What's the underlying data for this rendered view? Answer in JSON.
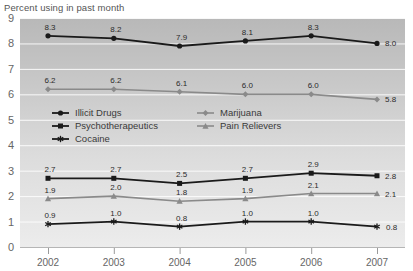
{
  "chart_data": {
    "type": "line",
    "title": "Percent using in past month",
    "xlabel": "",
    "ylabel": "",
    "categories": [
      "2002",
      "2003",
      "2004",
      "2005",
      "2006",
      "2007"
    ],
    "x": [
      2002,
      2003,
      2004,
      2005,
      2006,
      2007
    ],
    "ylim": [
      0,
      9
    ],
    "yticks": [
      "0",
      "1",
      "2",
      "3",
      "4",
      "5",
      "6",
      "7",
      "8",
      "9"
    ],
    "grid": true,
    "legend_position": "inside-upper-left",
    "series": [
      {
        "name": "Illicit Drugs",
        "marker": "circle",
        "color": "#1a1a1a",
        "values": [
          8.3,
          8.2,
          7.9,
          8.1,
          8.3,
          8.0
        ],
        "labels": [
          "8.3",
          "8.2",
          "7.9",
          "8.1",
          "8.3",
          "8.0"
        ]
      },
      {
        "name": "Marijuana",
        "marker": "diamond",
        "color": "#8a8a8a",
        "values": [
          6.2,
          6.2,
          6.1,
          6.0,
          6.0,
          5.8
        ],
        "labels": [
          "6.2",
          "6.2",
          "6.1",
          "6.0",
          "6.0",
          "5.8"
        ]
      },
      {
        "name": "Psychotherapeutics",
        "marker": "square",
        "color": "#1a1a1a",
        "values": [
          2.7,
          2.7,
          2.5,
          2.7,
          2.9,
          2.8
        ],
        "labels": [
          "2.7",
          "2.7",
          "2.5",
          "2.7",
          "2.9",
          "2.8"
        ]
      },
      {
        "name": "Pain Relievers",
        "marker": "triangle",
        "color": "#8a8a8a",
        "values": [
          1.9,
          2.0,
          1.8,
          1.9,
          2.1,
          2.1
        ],
        "labels": [
          "1.9",
          "2.0",
          "1.8",
          "1.9",
          "2.1",
          "2.1"
        ]
      },
      {
        "name": "Cocaine",
        "marker": "asterisk",
        "color": "#1a1a1a",
        "values": [
          0.9,
          1.0,
          0.8,
          1.0,
          1.0,
          0.8
        ],
        "labels": [
          "0.9",
          "1.0",
          "0.8",
          "1.0",
          "1.0",
          "0.8"
        ]
      }
    ],
    "colors": {
      "dark_series": "#1a1a1a",
      "gray_series": "#8a8a8a",
      "plot_bg_top": "#bcbcbc",
      "plot_bg_bottom": "#e6e6e6",
      "gridline": "#ffffff",
      "axis_text": "#666666"
    }
  },
  "legend": {
    "entries": [
      {
        "label": "Illicit Drugs"
      },
      {
        "label": "Marijuana"
      },
      {
        "label": "Psychotherapeutics"
      },
      {
        "label": "Pain Relievers"
      },
      {
        "label": "Cocaine"
      }
    ]
  }
}
